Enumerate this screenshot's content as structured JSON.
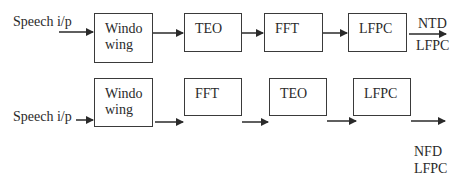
{
  "diagram": {
    "rows": [
      {
        "name": "ntd-lfpc-pipeline",
        "input_label": "Speech i/p",
        "blocks": [
          "Windo\nwing",
          "TEO",
          "FFT",
          "LFPC"
        ],
        "output_label_top": "NTD",
        "output_label_bottom": "LFPC"
      },
      {
        "name": "nfd-lfpc-pipeline",
        "input_label": "Speech i/p",
        "blocks": [
          "Windo\nwing",
          "FFT",
          "TEO",
          "LFPC"
        ],
        "output_label_top": "NFD",
        "output_label_bottom": "LFPC"
      }
    ],
    "colors": {
      "stroke": "#3a3a3a",
      "text": "#2a2a2a",
      "background": "#ffffff"
    }
  }
}
